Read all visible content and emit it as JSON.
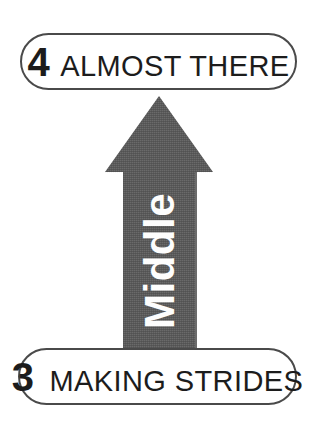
{
  "canvas": {
    "width": 315,
    "height": 422,
    "background_color": "#ffffff"
  },
  "colors": {
    "arrow_fill": "#6b6b6b",
    "arrow_text": "#fdfdfd",
    "pill_border": "#4a4a4a",
    "pill_fill": "#ffffff",
    "text": "#1c1c1c"
  },
  "stages": {
    "top": {
      "number": "4",
      "label": "ALMOST THERE"
    },
    "bottom": {
      "number": "3",
      "label": "MAKING STRIDES"
    }
  },
  "arrow": {
    "label": "Middle",
    "direction": "up",
    "orientation": "vertical-rotated-90-ccw",
    "fill_color": "#6b6b6b"
  }
}
